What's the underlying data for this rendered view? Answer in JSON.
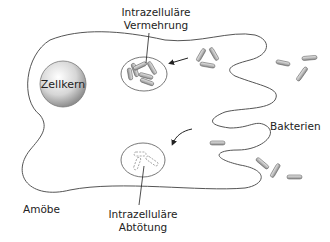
{
  "diagram": {
    "labels": {
      "nucleus": "Zellkern",
      "replication_line1": "Intrazelluläre",
      "replication_line2": "Vermehrung",
      "killing_line1": "Intrazelluläre",
      "killing_line2": "Abtötung",
      "bacteria": "Bakterien",
      "amoeba": "Amöbe"
    },
    "colors": {
      "outline": "#555555",
      "bacterium_fill": "#c8c8c8",
      "nucleus_light": "#ffffff",
      "nucleus_dark": "#9a9a9a",
      "text": "#222222"
    }
  }
}
